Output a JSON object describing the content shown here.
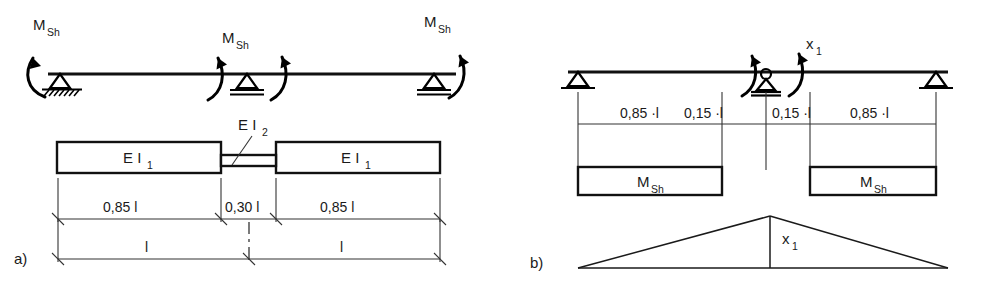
{
  "figure": {
    "type": "structural-engineering-diagram",
    "width": 988,
    "height": 282,
    "background_color": "#ffffff",
    "line_color": "#111111"
  },
  "panel_a": {
    "part_label": "a)",
    "moment_labels": [
      {
        "text": "M",
        "sub": "Sh"
      },
      {
        "text": "M",
        "sub": "Sh"
      },
      {
        "text": "M",
        "sub": "Sh"
      }
    ],
    "stiffness_labels": [
      {
        "text": "E I",
        "sub": "1"
      },
      {
        "text": "E I",
        "sub": "2"
      },
      {
        "text": "E I",
        "sub": "1"
      }
    ],
    "dimensions_upper": [
      "0,85 l",
      "0,30 l",
      "0,85 l"
    ],
    "dimensions_lower": [
      "l",
      "l"
    ],
    "supports": [
      "fixed-pinned-hatched",
      "roller",
      "roller"
    ]
  },
  "panel_b": {
    "part_label": "b)",
    "redundant_label": {
      "text": "x",
      "sub": "1"
    },
    "diagram_label": {
      "text": "x",
      "sub": "1"
    },
    "dimensions": [
      "0,85 ·l",
      "0,15 ·l",
      "0,15 ·l",
      "0,85 ·l"
    ],
    "moment_box_labels": [
      {
        "text": "M",
        "sub": "Sh"
      },
      {
        "text": "M",
        "sub": "Sh"
      }
    ],
    "supports": [
      "roller",
      "hinge-roller",
      "roller"
    ]
  }
}
